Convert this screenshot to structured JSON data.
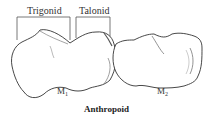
{
  "figure": {
    "caption": "Anthropoid",
    "brackets": [
      {
        "label": "Trigonid"
      },
      {
        "label": "Talonid"
      }
    ],
    "teeth": [
      {
        "base": "M",
        "subscript": "1"
      },
      {
        "base": "M",
        "subscript": "2"
      }
    ],
    "colors": {
      "outline": "#333333",
      "background": "#ffffff"
    }
  }
}
